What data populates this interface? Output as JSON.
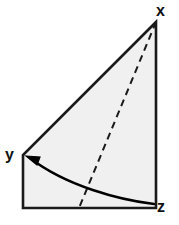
{
  "figure": {
    "kind": "geometry-diagram",
    "canvas": {
      "width": 179,
      "height": 225
    },
    "colors": {
      "background": "#ffffff",
      "fill": "#f0f0f0",
      "stroke": "#1a1a1a",
      "dash_stroke": "#1a1a1a",
      "arrow_stroke": "#000000",
      "label_color": "#111111"
    },
    "labels": [
      {
        "id": "x",
        "text": "x",
        "vertex": "apex-top-right"
      },
      {
        "id": "y",
        "text": "y",
        "vertex": "left-middle"
      },
      {
        "id": "z",
        "text": "z",
        "vertex": "bottom-right"
      }
    ],
    "geometry": {
      "outline_points": "156,22 23,155 23,208 156,208",
      "edges": [
        {
          "name": "edge-x-to-y",
          "from": "x",
          "to": "y"
        },
        {
          "name": "edge-y-to-bottom-left",
          "from": "y",
          "to": "bottom-left"
        },
        {
          "name": "edge-bottom",
          "from": "bottom-left",
          "to": "z"
        },
        {
          "name": "edge-z-to-x",
          "from": "z",
          "to": "x"
        }
      ],
      "dashed_segment": {
        "x1": 156,
        "y1": 22,
        "x2": 79,
        "y2": 208,
        "dash_pattern": "7 5",
        "width": 2
      },
      "curved_arrow": {
        "path": "M 154 204 C 120 200 66 186 30 158",
        "arrow_tip": {
          "x": 26,
          "y": 156
        },
        "width": 2.4
      }
    },
    "stroke_width": 2.6
  }
}
